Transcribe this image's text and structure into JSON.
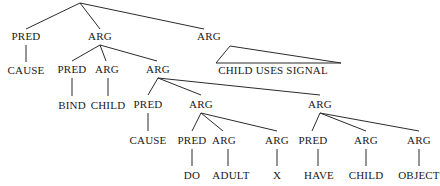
{
  "figure": {
    "name": "syntactic-dependency-tree",
    "background_color": "#ffffff",
    "line_color": "#2b2b2b",
    "text_color": "#1a1a1a"
  },
  "nodes": {
    "root": "",
    "n_pred_1": "PRED",
    "n_cause_1": "CAUSE",
    "n_arg_1": "ARG",
    "n_pred_2": "PRED",
    "n_bind": "BIND",
    "n_arg_2": "ARG",
    "n_child_1": "CHILD",
    "n_arg_3": "ARG",
    "n_pred_3": "PRED",
    "n_cause_2": "CAUSE",
    "n_arg_4": "ARG",
    "n_pred_4": "PRED",
    "n_do": "DO",
    "n_arg_5": "ARG",
    "n_adult": "ADULT",
    "n_arg_6": "ARG",
    "n_x": "X",
    "n_arg_7": "ARG",
    "n_pred_5": "PRED",
    "n_have": "HAVE",
    "n_arg_8": "ARG",
    "n_child_2": "CHILD",
    "n_arg_9": "ARG",
    "n_object": "OBJECT",
    "n_arg_top_right": "ARG",
    "n_phrase": "CHILD USES SIGNAL"
  },
  "tree_structure": {
    "root_children": [
      "PRED",
      "ARG",
      "ARG"
    ],
    "left_branch": {
      "label": "PRED",
      "child": "CAUSE"
    },
    "middle_branch": {
      "label": "ARG",
      "children": [
        "PRED",
        "ARG",
        "ARG"
      ],
      "pred_child": "BIND",
      "arg_child": "CHILD",
      "deep_arg": {
        "children": [
          "PRED",
          "ARG",
          "ARG"
        ],
        "pred_child": "CAUSE",
        "first_arg_children": [
          "PRED",
          "ARG",
          "ARG"
        ],
        "first_arg_terminals": [
          "DO",
          "ADULT",
          "X"
        ],
        "second_arg_children": [
          "PRED",
          "ARG",
          "ARG"
        ],
        "second_arg_terminals": [
          "HAVE",
          "CHILD",
          "OBJECT"
        ]
      }
    },
    "right_branch": {
      "label": "ARG",
      "phrase": "CHILD USES SIGNAL",
      "notation": "triangle"
    }
  }
}
